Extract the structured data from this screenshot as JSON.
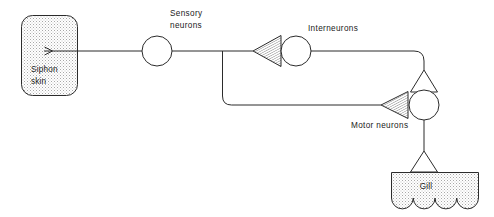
{
  "figure": {
    "type": "neural-circuit-diagram",
    "background_color": "#ffffff",
    "stroke_color": "#2b2b2b",
    "stipple_color": "#9a9a9a"
  },
  "nodes": {
    "siphon_skin": {
      "label_line1": "Siphon",
      "label_line2": "skin",
      "shape": "rounded-rectangle",
      "fill": "stipple"
    },
    "gill": {
      "label": "Gill",
      "shape": "scalloped-rectangle",
      "fill": "stipple",
      "scallops": 4
    },
    "sensory_neuron": {
      "label_line1": "Sensory",
      "label_line2": "neurons",
      "shape": "circle"
    },
    "interneuron": {
      "label": "Interneurons",
      "shape": "circle"
    },
    "motor_neuron": {
      "label": "Motor  neurons",
      "shape": "circle"
    }
  },
  "synapses": [
    {
      "name": "sensory-to-interneuron",
      "style": "hatched-triangle",
      "direction": "left"
    },
    {
      "name": "sensory-to-motor",
      "style": "hatched-triangle",
      "direction": "left"
    },
    {
      "name": "interneuron-to-motor",
      "style": "open-triangle",
      "direction": "up"
    },
    {
      "name": "motor-to-gill",
      "style": "open-triangle",
      "direction": "up"
    }
  ],
  "connections": [
    {
      "name": "siphon-to-sensory",
      "from": "siphon_skin",
      "to": "sensory_neuron",
      "arrow": true
    },
    {
      "name": "sensory-to-interneuron-path",
      "from": "sensory_neuron",
      "to": "interneuron"
    },
    {
      "name": "sensory-branch-to-motor-path",
      "from": "sensory_neuron",
      "to": "motor_neuron"
    },
    {
      "name": "interneuron-to-motor-path",
      "from": "interneuron",
      "to": "motor_neuron"
    },
    {
      "name": "motor-to-gill-path",
      "from": "motor_neuron",
      "to": "gill"
    }
  ]
}
